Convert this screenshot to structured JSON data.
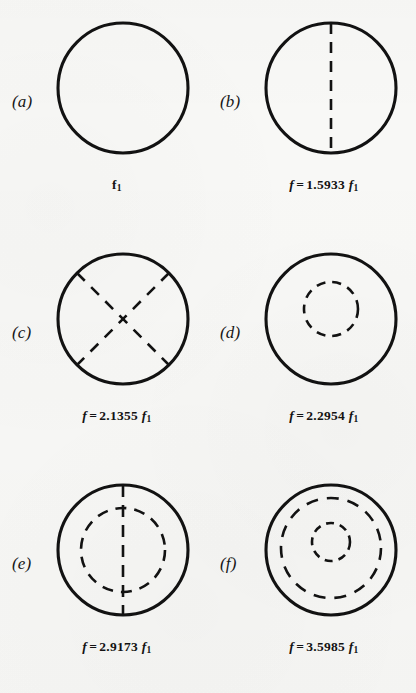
{
  "figure": {
    "background_color": "#f8f8f6",
    "ink_color": "#121212",
    "panels": [
      {
        "id": "a",
        "letter": "(a)",
        "caption": {
          "lhs": "",
          "eq": "",
          "value": "",
          "base": "f",
          "base_sub": "1"
        },
        "caption_text": "f1",
        "nodal_lines": {
          "diameters": 0,
          "inner_circles": 0
        },
        "frequency_ratio": 1.0
      },
      {
        "id": "b",
        "letter": "(b)",
        "caption": {
          "lhs": "f",
          "eq": "=",
          "value": "1.5933",
          "base": "f",
          "base_sub": "1"
        },
        "caption_text": "f = 1.5933 f1",
        "nodal_lines": {
          "diameters": 1,
          "inner_circles": 0
        },
        "frequency_ratio": 1.5933
      },
      {
        "id": "c",
        "letter": "(c)",
        "caption": {
          "lhs": "f",
          "eq": "=",
          "value": "2.1355",
          "base": "f",
          "base_sub": "1"
        },
        "caption_text": "f = 2.1355 f1",
        "nodal_lines": {
          "diameters": 2,
          "inner_circles": 0
        },
        "frequency_ratio": 2.1355
      },
      {
        "id": "d",
        "letter": "(d)",
        "caption": {
          "lhs": "f",
          "eq": "=",
          "value": "2.2954",
          "base": "f",
          "base_sub": "1"
        },
        "caption_text": "f = 2.2954 f1",
        "nodal_lines": {
          "diameters": 0,
          "inner_circles": 1
        },
        "frequency_ratio": 2.2954
      },
      {
        "id": "e",
        "letter": "(e)",
        "caption": {
          "lhs": "f",
          "eq": "=",
          "value": "2.9173",
          "base": "f",
          "base_sub": "1"
        },
        "caption_text": "f = 2.9173 f1",
        "nodal_lines": {
          "diameters": 1,
          "inner_circles": 1
        },
        "frequency_ratio": 2.9173
      },
      {
        "id": "f",
        "letter": "(f)",
        "caption": {
          "lhs": "f",
          "eq": "=",
          "value": "3.5985",
          "base": "f",
          "base_sub": "1"
        },
        "caption_text": "f = 3.5985 f1",
        "nodal_lines": {
          "diameters": 0,
          "inner_circles": 2
        },
        "frequency_ratio": 3.5985
      }
    ]
  }
}
